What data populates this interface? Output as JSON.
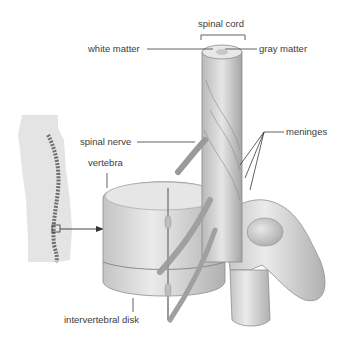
{
  "diagram": {
    "labels": {
      "spinal_cord": "spinal cord",
      "white_matter": "white matter",
      "gray_matter": "gray matter",
      "spinal_nerve": "spinal nerve",
      "meninges": "meninges",
      "vertebra": "vertebra",
      "intervertebral_disk": "intervertebral disk"
    },
    "inset": "human body silhouette with spine, lumbar region boxed and arrowed to enlarged view",
    "colors": {
      "background": "#ffffff",
      "silhouette": "#e4e4e4",
      "bone": "#d8d8d8",
      "shadow": "#9a9a9a",
      "line": "#3a3a3a"
    }
  }
}
